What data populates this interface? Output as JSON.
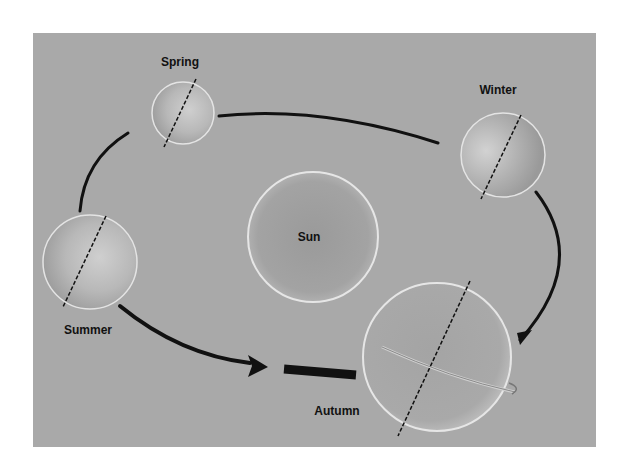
{
  "diagram": {
    "title": "",
    "type": "earth-orbit-seasons",
    "colors": {
      "page_background": "#ffffff",
      "panel_background": "#a9a9a9",
      "orbit_arrow": "#111111",
      "axis_line": "#111111",
      "sphere_rim": "#e8e8e8"
    },
    "center_body": {
      "label": "Sun"
    },
    "positions": [
      {
        "id": "spring",
        "label": "Spring"
      },
      {
        "id": "winter",
        "label": "Winter"
      },
      {
        "id": "summer",
        "label": "Summer"
      },
      {
        "id": "autumn",
        "label": "Autumn"
      }
    ],
    "orbit_direction": "counterclockwise",
    "notes": [
      "Dashed line through each Earth indicates tilted rotation axis",
      "Autumn Earth shows rotation arrow around its equator"
    ]
  }
}
